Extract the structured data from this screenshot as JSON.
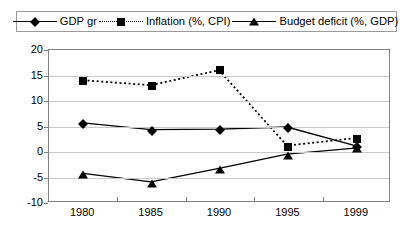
{
  "chart_data": {
    "type": "line",
    "title": "",
    "subtitle": "",
    "xlabel": "",
    "ylabel": "",
    "categories": [
      "1980",
      "1985",
      "1990",
      "1995",
      "1999"
    ],
    "ylim": [
      -10,
      20
    ],
    "yticks": [
      "20",
      "15",
      "10",
      "5",
      "0",
      "-5",
      "-10"
    ],
    "ytick_values": [
      20,
      15,
      10,
      5,
      0,
      -5,
      -10
    ],
    "grid": true,
    "legend_position": "top",
    "series": [
      {
        "name": "GDP gr",
        "marker": "diamond",
        "line": "solid",
        "color": "#000000",
        "values": [
          5.5,
          4.2,
          4.3,
          4.7,
          1.0
        ]
      },
      {
        "name": "Inflation (%, CPI)",
        "marker": "square",
        "line": "dotted",
        "color": "#000000",
        "values": [
          14.0,
          13.0,
          16.0,
          1.0,
          2.5
        ]
      },
      {
        "name": "Budget deficit (%, GDP)",
        "marker": "triangle",
        "line": "solid",
        "color": "#000000",
        "values": [
          -4.5,
          -6.2,
          -3.5,
          -0.7,
          0.5
        ]
      }
    ]
  },
  "legend": {
    "entries": [
      {
        "label": "GDP gr",
        "icon": "diamond-marker-icon"
      },
      {
        "label": "Inflation (%, CPI)",
        "icon": "square-marker-icon"
      },
      {
        "label": "Budget deficit (%, GDP)",
        "icon": "triangle-marker-icon"
      }
    ]
  }
}
